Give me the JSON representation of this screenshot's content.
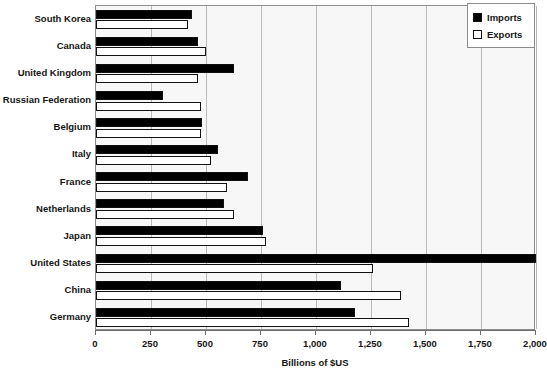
{
  "chart_data": {
    "type": "bar",
    "orientation": "horizontal",
    "title": "",
    "xlabel": "Billions of $US",
    "ylabel": "",
    "xlim": [
      0,
      2000
    ],
    "xticks": [
      0,
      250,
      500,
      750,
      1000,
      1250,
      1500,
      1750,
      2000
    ],
    "xticklabels": [
      "0",
      "250",
      "500",
      "750",
      "1,000",
      "1,250",
      "1,500",
      "1,750",
      "2,000"
    ],
    "grid": true,
    "grid_axis": "x",
    "legend_position": "top-right",
    "categories": [
      "South Korea",
      "Canada",
      "United Kingdom",
      "Russian Federation",
      "Belgium",
      "Italy",
      "France",
      "Netherlands",
      "Japan",
      "United States",
      "China",
      "Germany"
    ],
    "series": [
      {
        "name": "Imports",
        "color": "#000000",
        "values": [
          436,
          462,
          627,
          305,
          482,
          555,
          691,
          582,
          759,
          2000,
          1114,
          1177
        ]
      },
      {
        "name": "Exports",
        "color": "#ffffff",
        "values": [
          418,
          500,
          464,
          477,
          477,
          523,
          595,
          627,
          773,
          1259,
          1386,
          1423
        ]
      }
    ]
  },
  "legend": {
    "items": [
      {
        "label": "Imports",
        "swatch": "filled-black-square-icon"
      },
      {
        "label": "Exports",
        "swatch": "outlined-white-square-icon"
      }
    ]
  },
  "colors": {
    "imports": "#000000",
    "exports": "#ffffff",
    "plot_background": "#f7f7f7",
    "gridline": "#b9b9b9",
    "axis": "#6f6f6f",
    "text": "#151515"
  }
}
